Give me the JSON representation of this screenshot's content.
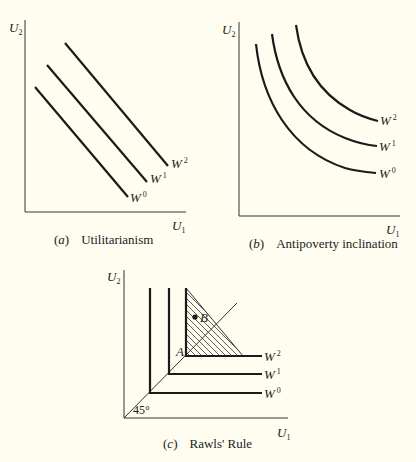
{
  "figure": {
    "background": "#fffdf0",
    "line_color": "#1a1a1a",
    "panels": [
      {
        "id": "a",
        "tag": "a",
        "title": "Utilitarianism",
        "y_axis": {
          "symbol": "U",
          "sub": "2"
        },
        "x_axis": {
          "symbol": "U",
          "sub": "1"
        },
        "curve_shape": "straight lines, slope -1",
        "curves": [
          {
            "symbol": "W",
            "sup": "0"
          },
          {
            "symbol": "W",
            "sup": "1"
          },
          {
            "symbol": "W",
            "sup": "2"
          }
        ]
      },
      {
        "id": "b",
        "tag": "b",
        "title": "Antipoverty inclination",
        "y_axis": {
          "symbol": "U",
          "sub": "2"
        },
        "x_axis": {
          "symbol": "U",
          "sub": "1"
        },
        "curve_shape": "convex curves",
        "curves": [
          {
            "symbol": "W",
            "sup": "0"
          },
          {
            "symbol": "W",
            "sup": "1"
          },
          {
            "symbol": "W",
            "sup": "2"
          }
        ]
      },
      {
        "id": "c",
        "tag": "c",
        "title": "Rawls' Rule",
        "y_axis": {
          "symbol": "U",
          "sub": "2"
        },
        "x_axis": {
          "symbol": "U",
          "sub": "1"
        },
        "curve_shape": "L-shaped (right angle) contours on 45-degree line",
        "curves": [
          {
            "symbol": "W",
            "sup": "0"
          },
          {
            "symbol": "W",
            "sup": "1"
          },
          {
            "symbol": "W",
            "sup": "2"
          }
        ],
        "angle_label": "45°",
        "point_a": "A",
        "point_b": "B"
      }
    ]
  }
}
